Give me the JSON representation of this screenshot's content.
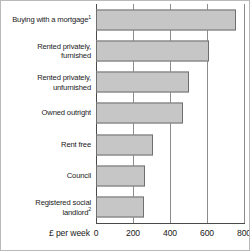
{
  "chart_data": {
    "type": "bar",
    "orientation": "horizontal",
    "title": "",
    "subtitle": "",
    "xlabel": "£ per week",
    "ylabel": "",
    "categories": [
      "Buying with a mortgage¹",
      "Rented privately, furnished",
      "Rented privately, unfurnished",
      "Owned outright",
      "Rent free",
      "Council",
      "Registered social landlord²"
    ],
    "values": [
      757,
      611,
      503,
      470,
      308,
      266,
      260
    ],
    "xlim": [
      0,
      800
    ],
    "xticks": [
      0,
      200,
      400,
      600,
      800
    ],
    "xtick_labels": [
      "0",
      "200",
      "400",
      "600",
      "800"
    ],
    "grid": true,
    "legend": false,
    "bar_color": "#c6c6c6",
    "bar_border_color": "#6f6f6f",
    "axis_color": "#4a4a4a",
    "gridline_color": "#8c8c8c"
  },
  "labels": {
    "rows": [
      {
        "line1": "Buying with a mortgage",
        "sup": "1",
        "line2": ""
      },
      {
        "line1": "Rented privately,",
        "sup": "",
        "line2": "furnished"
      },
      {
        "line1": "Rented privately,",
        "sup": "",
        "line2": "unfurnished"
      },
      {
        "line1": "Owned outright",
        "sup": "",
        "line2": ""
      },
      {
        "line1": "Rent free",
        "sup": "",
        "line2": ""
      },
      {
        "line1": "Council",
        "sup": "",
        "line2": ""
      },
      {
        "line1": "Registered social",
        "sup": "2",
        "line2": "landlord"
      }
    ]
  },
  "axis": {
    "title": "£ per week",
    "ticks": [
      "0",
      "200",
      "400",
      "600",
      "800"
    ]
  }
}
